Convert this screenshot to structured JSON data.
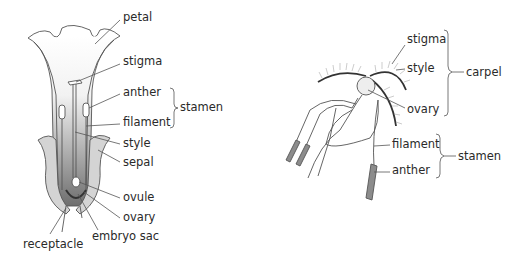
{
  "left_diagram": {
    "labels": {
      "petal": "petal",
      "stigma": "stigma",
      "anther": "anther",
      "filament": "filament",
      "stamen": "stamen",
      "style": "style",
      "sepal": "sepal",
      "ovule": "ovule",
      "ovary": "ovary",
      "embryo_sac": "embryo sac",
      "receptacle": "receptacle"
    }
  },
  "right_diagram": {
    "labels": {
      "stigma": "stigma",
      "style": "style",
      "ovary": "ovary",
      "carpel": "carpel",
      "filament": "filament",
      "anther": "anther",
      "stamen": "stamen"
    }
  },
  "colors": {
    "line": "#555555",
    "text": "#2a2a2a",
    "sepal_fill": "#d4d4d4",
    "anther_fill": "#8c8c8c"
  }
}
